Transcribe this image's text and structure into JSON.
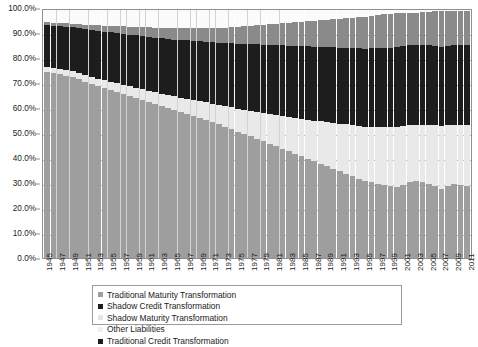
{
  "chart_data": {
    "type": "area",
    "subtype": "100%-stacked-column",
    "title": "",
    "xlabel": "",
    "ylabel": "",
    "ylim": [
      0,
      100
    ],
    "ytick_labels": [
      "0.0%",
      "10.0%",
      "20.0%",
      "30.0%",
      "40.0%",
      "50.0%",
      "60.0%",
      "70.0%",
      "80.0%",
      "90.0%",
      "100.0%"
    ],
    "ytick_values": [
      0,
      10,
      20,
      30,
      40,
      50,
      60,
      70,
      80,
      90,
      100
    ],
    "grid": true,
    "legend_position": "bottom",
    "x": [
      1945,
      1946,
      1947,
      1948,
      1949,
      1950,
      1951,
      1952,
      1953,
      1954,
      1955,
      1956,
      1957,
      1958,
      1959,
      1960,
      1961,
      1962,
      1963,
      1964,
      1965,
      1966,
      1967,
      1968,
      1969,
      1970,
      1971,
      1972,
      1973,
      1974,
      1975,
      1976,
      1977,
      1978,
      1979,
      1980,
      1981,
      1982,
      1983,
      1984,
      1985,
      1986,
      1987,
      1988,
      1989,
      1990,
      1991,
      1992,
      1993,
      1994,
      1995,
      1996,
      1997,
      1998,
      1999,
      2000,
      2001,
      2002,
      2003,
      2004,
      2005,
      2006,
      2007,
      2008,
      2009,
      2010,
      2011
    ],
    "xtick_labels": [
      "1945",
      "1947",
      "1949",
      "1951",
      "1953",
      "1955",
      "1957",
      "1959",
      "1961",
      "1963",
      "1965",
      "1967",
      "1969",
      "1971",
      "1973",
      "1975",
      "1977",
      "1979",
      "1981",
      "1983",
      "1985",
      "1987",
      "1989",
      "1991",
      "1993",
      "1995",
      "1997",
      "1999",
      "2001",
      "2003",
      "2005",
      "2007",
      "2009",
      "2011"
    ],
    "xtick_interval": 2,
    "stack_order_bottom_to_top": [
      "Traditional Maturity Transformation",
      "Shadow Maturity Transformation",
      "Traditional Credit Transformation",
      "Shadow Credit Transformation",
      "Other Liabilities"
    ],
    "series": [
      {
        "name": "Traditional Maturity Transformation",
        "color": "#9e9e9e",
        "values": [
          75.0,
          74.5,
          74.0,
          73.5,
          73.0,
          72.0,
          71.0,
          70.0,
          69.2,
          68.4,
          67.6,
          66.8,
          66.0,
          65.2,
          64.4,
          63.6,
          62.8,
          62.0,
          61.2,
          60.4,
          59.6,
          58.8,
          58.0,
          57.2,
          56.4,
          55.6,
          54.8,
          54.0,
          53.0,
          52.0,
          51.0,
          50.0,
          49.0,
          48.0,
          47.0,
          46.0,
          45.0,
          44.0,
          43.0,
          42.0,
          41.0,
          40.0,
          39.0,
          38.0,
          37.0,
          36.0,
          35.0,
          34.0,
          33.0,
          32.0,
          31.0,
          30.5,
          30.0,
          29.5,
          29.0,
          28.5,
          29.5,
          30.5,
          31.0,
          30.5,
          30.0,
          29.0,
          28.0,
          29.0,
          30.0,
          29.5,
          29.0
        ]
      },
      {
        "name": "Shadow Maturity Transformation",
        "color": "#e9e9e9",
        "values": [
          2.0,
          2.0,
          2.1,
          2.2,
          2.3,
          2.5,
          2.7,
          2.9,
          3.1,
          3.3,
          3.5,
          3.7,
          3.9,
          4.1,
          4.3,
          4.5,
          4.7,
          4.9,
          5.1,
          5.3,
          5.6,
          5.9,
          6.2,
          6.5,
          6.8,
          7.1,
          7.4,
          7.7,
          8.2,
          8.7,
          9.2,
          9.7,
          10.2,
          10.8,
          11.4,
          12.0,
          12.6,
          13.2,
          13.8,
          14.4,
          15.0,
          15.7,
          16.4,
          17.1,
          17.8,
          18.5,
          19.2,
          19.9,
          20.6,
          21.3,
          22.0,
          22.5,
          23.0,
          23.5,
          24.0,
          24.5,
          23.8,
          23.0,
          22.6,
          23.1,
          23.6,
          24.5,
          25.4,
          24.6,
          23.8,
          24.3,
          24.8
        ]
      },
      {
        "name": "Traditional Credit Transformation",
        "color": "#1d1d1d",
        "values": [
          17.0,
          17.2,
          17.4,
          17.6,
          17.8,
          18.2,
          18.6,
          19.0,
          19.3,
          19.6,
          19.9,
          20.2,
          20.5,
          20.8,
          21.1,
          21.4,
          21.7,
          22.0,
          22.3,
          22.6,
          22.9,
          23.2,
          23.5,
          23.8,
          24.1,
          24.4,
          24.7,
          25.0,
          25.4,
          25.8,
          26.2,
          26.6,
          27.0,
          27.3,
          27.6,
          27.9,
          28.2,
          28.5,
          28.8,
          29.1,
          29.4,
          29.6,
          29.8,
          30.0,
          30.2,
          30.4,
          30.6,
          30.8,
          31.0,
          31.2,
          31.4,
          31.5,
          31.6,
          31.7,
          31.8,
          31.9,
          32.1,
          32.3,
          32.4,
          32.3,
          32.2,
          32.0,
          31.8,
          32.0,
          32.2,
          32.1,
          32.0
        ]
      },
      {
        "name": "Shadow Credit Transformation",
        "color": "#8a8a8a",
        "values": [
          1.0,
          1.1,
          1.2,
          1.3,
          1.4,
          1.6,
          1.8,
          2.0,
          2.2,
          2.4,
          2.6,
          2.8,
          3.0,
          3.2,
          3.4,
          3.6,
          3.8,
          4.0,
          4.2,
          4.4,
          4.6,
          4.8,
          5.0,
          5.2,
          5.4,
          5.6,
          5.8,
          6.0,
          6.3,
          6.6,
          6.9,
          7.2,
          7.5,
          7.8,
          8.1,
          8.4,
          8.7,
          9.0,
          9.3,
          9.6,
          9.9,
          10.2,
          10.5,
          10.8,
          11.1,
          11.4,
          11.7,
          12.0,
          12.3,
          12.6,
          12.9,
          13.1,
          13.3,
          13.5,
          13.7,
          13.9,
          13.5,
          13.1,
          12.9,
          13.2,
          13.5,
          13.9,
          14.3,
          13.9,
          13.5,
          13.7,
          13.9
        ]
      },
      {
        "name": "Other Liabilities",
        "color": "#fbfbfb",
        "values": [
          5.0,
          5.2,
          5.3,
          5.4,
          5.5,
          5.7,
          5.9,
          6.1,
          6.2,
          6.3,
          6.4,
          6.5,
          6.6,
          6.7,
          6.8,
          6.9,
          7.0,
          7.1,
          7.2,
          7.3,
          7.3,
          7.3,
          7.3,
          7.3,
          7.3,
          7.3,
          7.3,
          7.3,
          7.1,
          6.9,
          6.7,
          6.5,
          6.3,
          6.1,
          5.9,
          5.7,
          5.5,
          5.3,
          5.1,
          4.9,
          4.7,
          4.5,
          4.3,
          4.1,
          3.9,
          3.7,
          3.5,
          3.3,
          3.1,
          2.9,
          2.7,
          2.4,
          2.1,
          1.8,
          1.5,
          1.2,
          1.1,
          1.1,
          1.1,
          0.9,
          0.7,
          0.6,
          0.5,
          0.5,
          0.5,
          0.4,
          0.3
        ]
      }
    ]
  },
  "legend": {
    "items": [
      {
        "label": "Traditional Maturity Transformation",
        "swatch": "sw-tradmat",
        "column": "col-a"
      },
      {
        "label": "Shadow Credit Transformation",
        "swatch": "sw-shadowcred",
        "column": "col-b"
      },
      {
        "label": "Shadow Maturity Transformation",
        "swatch": "sw-shadowmat",
        "column": "col-a"
      },
      {
        "label": "Other Liabilities",
        "swatch": "sw-other",
        "column": "col-b"
      },
      {
        "label": "Traditional Credit Transformation",
        "swatch": "sw-tradcred",
        "column": "col-a"
      }
    ]
  },
  "colors": {
    "traditional_maturity": "#9e9e9e",
    "shadow_maturity": "#e9e9e9",
    "traditional_credit": "#1d1d1d",
    "shadow_credit": "#8a8a8a",
    "other_liabilities": "#fbfbfb",
    "gridline": "#b4b4b4",
    "axis": "#8f8f8f"
  }
}
